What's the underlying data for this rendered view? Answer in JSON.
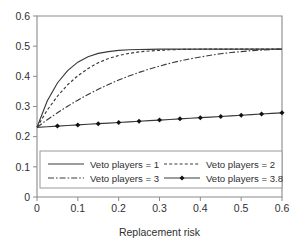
{
  "chart_data": {
    "type": "line",
    "title": "",
    "xlabel": "Replacement risk",
    "ylabel": "",
    "xlim": [
      0,
      0.6
    ],
    "ylim": [
      0,
      0.6
    ],
    "xticks": [
      "0",
      "0.1",
      "0.2",
      "0.3",
      "0.4",
      "0.5",
      "0.6"
    ],
    "xtick_values": [
      0,
      0.1,
      0.2,
      0.3,
      0.4,
      0.5,
      0.6
    ],
    "yticks": [
      "0",
      "0.1",
      "0.2",
      "0.3",
      "0.4",
      "0.5",
      "0.6"
    ],
    "ytick_values": [
      0,
      0.1,
      0.2,
      0.3,
      0.4,
      0.5,
      0.6
    ],
    "grid": false,
    "legend_position": "lower-center",
    "x": [
      0,
      0.025,
      0.05,
      0.075,
      0.1,
      0.125,
      0.15,
      0.175,
      0.2,
      0.225,
      0.25,
      0.275,
      0.3,
      0.325,
      0.35,
      0.375,
      0.4,
      0.425,
      0.45,
      0.475,
      0.5,
      0.525,
      0.55,
      0.575,
      0.6
    ],
    "series": [
      {
        "name": "Veto players = 1",
        "style": "solid",
        "marker": "none",
        "color": "#3a3a3a",
        "values": [
          0.231,
          0.318,
          0.378,
          0.419,
          0.447,
          0.465,
          0.476,
          0.482,
          0.486,
          0.488,
          0.489,
          0.4895,
          0.49,
          0.49,
          0.49,
          0.49,
          0.49,
          0.49,
          0.49,
          0.49,
          0.49,
          0.49,
          0.49,
          0.49,
          0.49
        ]
      },
      {
        "name": "Veto players = 2",
        "style": "dashed",
        "marker": "none",
        "color": "#3a3a3a",
        "values": [
          0.231,
          0.288,
          0.334,
          0.372,
          0.402,
          0.426,
          0.445,
          0.459,
          0.469,
          0.476,
          0.481,
          0.484,
          0.486,
          0.488,
          0.489,
          0.4895,
          0.49,
          0.49,
          0.49,
          0.49,
          0.49,
          0.49,
          0.49,
          0.49,
          0.49
        ]
      },
      {
        "name": "Veto players = 3",
        "style": "dashdot",
        "marker": "none",
        "color": "#3a3a3a",
        "values": [
          0.231,
          0.256,
          0.279,
          0.301,
          0.321,
          0.34,
          0.357,
          0.373,
          0.388,
          0.401,
          0.413,
          0.424,
          0.434,
          0.443,
          0.451,
          0.458,
          0.464,
          0.47,
          0.475,
          0.479,
          0.482,
          0.485,
          0.487,
          0.489,
          0.49
        ]
      },
      {
        "name": "Veto players = 3.8",
        "style": "solid",
        "marker": "diamond",
        "color": "#3a3a3a",
        "marker_x": [
          0.05,
          0.1,
          0.15,
          0.2,
          0.25,
          0.3,
          0.35,
          0.4,
          0.45,
          0.5,
          0.55,
          0.6
        ],
        "marker_values": [
          0.235,
          0.239,
          0.243,
          0.247,
          0.251,
          0.255,
          0.259,
          0.263,
          0.267,
          0.271,
          0.275,
          0.279
        ],
        "values": [
          0.231,
          0.233,
          0.235,
          0.237,
          0.239,
          0.241,
          0.243,
          0.245,
          0.247,
          0.249,
          0.251,
          0.253,
          0.255,
          0.257,
          0.259,
          0.261,
          0.263,
          0.265,
          0.267,
          0.269,
          0.271,
          0.273,
          0.275,
          0.277,
          0.279
        ]
      }
    ]
  },
  "legend": {
    "entries": [
      {
        "label": "Veto players = 1"
      },
      {
        "label": "Veto players = 2"
      },
      {
        "label": "Veto players = 3"
      },
      {
        "label": "Veto players = 3.8"
      }
    ]
  },
  "axes": {
    "x_title": "Replacement risk"
  }
}
